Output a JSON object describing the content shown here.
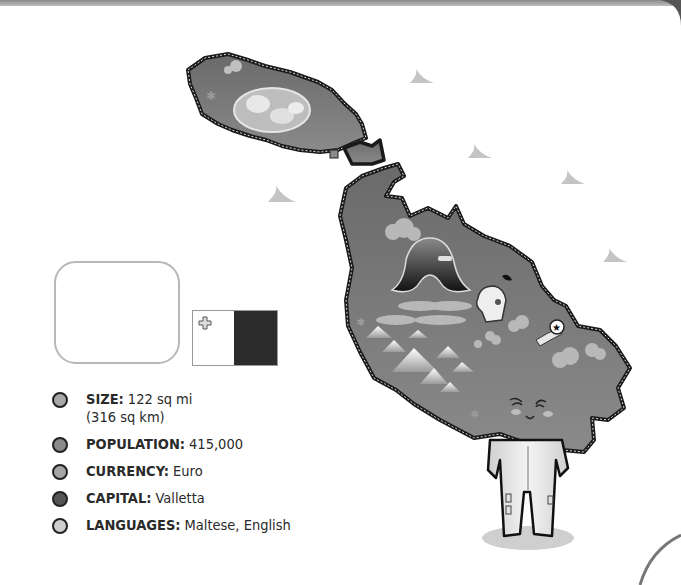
{
  "country": "Malta",
  "facts": [
    {
      "label": "SIZE:",
      "value": "122 sq mi",
      "sub": "(316 sq km)",
      "bullet_color": "#a8a8a8"
    },
    {
      "label": "POPULATION:",
      "value": "415,000",
      "sub": "",
      "bullet_color": "#8a8a8a"
    },
    {
      "label": "CURRENCY:",
      "value": "Euro",
      "sub": "",
      "bullet_color": "#a5a5a5"
    },
    {
      "label": "CAPITAL:",
      "value": "Valletta",
      "sub": "",
      "bullet_color": "#555555"
    },
    {
      "label": "LANGUAGES:",
      "value": "Maltese, English",
      "sub": "",
      "bullet_color": "#cfcfcf"
    }
  ],
  "locator_map": {
    "region": "Europe",
    "arrow": "pointing-to-malta"
  },
  "flag": {
    "left_color": "#ffffff",
    "right_color": "#2c2c2c",
    "emblem": "george-cross"
  },
  "map": {
    "islands": [
      "Gozo",
      "Comino",
      "Malta"
    ],
    "icons": [
      "knight-helmet-icon",
      "star-marker-icon",
      "dome-icon",
      "mountain-icon",
      "cloud-icon",
      "palm-icon"
    ],
    "mascot": "smiling-island-character"
  }
}
